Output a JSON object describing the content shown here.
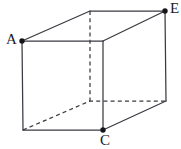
{
  "figure": {
    "kind": "cuboid-net-diagram",
    "canvas": {
      "width": 181,
      "height": 149,
      "background": "#ffffff"
    },
    "style": {
      "line_color": "#3a3a42",
      "line_width": 1.25,
      "hidden_dash": "4 3.2",
      "dot_color": "#16161a",
      "dot_radius": 2.6,
      "label_color": "#1a1a1f",
      "label_font_size": 15
    },
    "vertices": {
      "front_top_left": {
        "id": "A",
        "x": 22,
        "y": 41,
        "visible": true,
        "labeled": true
      },
      "front_top_right": {
        "id": "",
        "x": 103,
        "y": 41,
        "visible": true,
        "labeled": false
      },
      "front_bottom_left": {
        "id": "",
        "x": 23,
        "y": 130,
        "visible": true,
        "labeled": false
      },
      "front_bottom_right": {
        "id": "C",
        "x": 103,
        "y": 130,
        "visible": true,
        "labeled": true
      },
      "back_top_left": {
        "id": "",
        "x": 90,
        "y": 11,
        "visible": false,
        "labeled": false
      },
      "back_top_right": {
        "id": "E",
        "x": 165,
        "y": 11,
        "visible": true,
        "labeled": true
      },
      "back_bottom_left": {
        "id": "",
        "x": 90,
        "y": 101,
        "visible": false,
        "labeled": false
      },
      "back_bottom_right": {
        "id": "",
        "x": 166,
        "y": 101,
        "visible": true,
        "labeled": false
      }
    },
    "edges_solid": [
      {
        "name": "front-top",
        "x1": 22,
        "y1": 41,
        "x2": 103,
        "y2": 41
      },
      {
        "name": "front-left",
        "x1": 22,
        "y1": 41,
        "x2": 23,
        "y2": 130
      },
      {
        "name": "front-bottom",
        "x1": 23,
        "y1": 130,
        "x2": 103,
        "y2": 130
      },
      {
        "name": "front-right",
        "x1": 103,
        "y1": 41,
        "x2": 103,
        "y2": 130
      },
      {
        "name": "top-left-diagonal",
        "x1": 22,
        "y1": 41,
        "x2": 90,
        "y2": 11
      },
      {
        "name": "back-top",
        "x1": 90,
        "y1": 11,
        "x2": 165,
        "y2": 11
      },
      {
        "name": "top-right-diagonal",
        "x1": 103,
        "y1": 41,
        "x2": 165,
        "y2": 11
      },
      {
        "name": "back-right-vertical",
        "x1": 165,
        "y1": 11,
        "x2": 166,
        "y2": 101
      },
      {
        "name": "bottom-right-diagonal",
        "x1": 103,
        "y1": 130,
        "x2": 166,
        "y2": 101
      }
    ],
    "edges_hidden": [
      {
        "name": "back-left-vertical",
        "x1": 90,
        "y1": 11,
        "x2": 90,
        "y2": 101
      },
      {
        "name": "back-bottom",
        "x1": 90,
        "y1": 101,
        "x2": 166,
        "y2": 101
      },
      {
        "name": "bottom-left-diagonal",
        "x1": 23,
        "y1": 130,
        "x2": 90,
        "y2": 101
      }
    ],
    "labels": {
      "a": {
        "text": "A",
        "x": 6,
        "y": 32
      },
      "c": {
        "text": "C",
        "x": 100,
        "y": 133
      },
      "e": {
        "text": "E",
        "x": 170,
        "y": 1
      }
    }
  }
}
